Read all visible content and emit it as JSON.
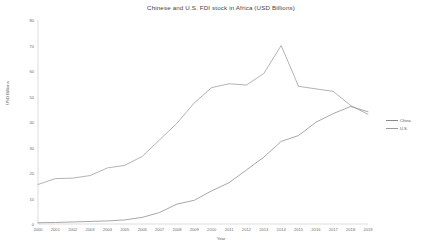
{
  "chart_data": {
    "type": "line",
    "title": "Chinese and U.S. FDI stock in Africa (USD Billions)",
    "xlabel": "Year",
    "ylabel": "USD Billions",
    "x": [
      2000,
      2001,
      2002,
      2003,
      2004,
      2005,
      2006,
      2007,
      2008,
      2009,
      2010,
      2011,
      2012,
      2013,
      2014,
      2015,
      2016,
      2017,
      2018,
      2019
    ],
    "categories": [
      "2000",
      "2001",
      "2002",
      "2003",
      "2004",
      "2005",
      "2006",
      "2007",
      "2008",
      "2009",
      "2010",
      "2011",
      "2012",
      "2013",
      "2014",
      "2015",
      "2016",
      "2017",
      "2018",
      "2019"
    ],
    "xlim": [
      2000,
      2019
    ],
    "ylim": [
      0,
      80
    ],
    "yticks": [
      0,
      10,
      20,
      30,
      40,
      50,
      60,
      70,
      80
    ],
    "ytick_labels": [
      "0",
      "10",
      "20",
      "30",
      "40",
      "50",
      "60",
      "70",
      "80"
    ],
    "grid": false,
    "legend_position": "right",
    "series": [
      {
        "name": "China",
        "color": "#8a8a8a",
        "values": [
          0.5,
          0.6,
          0.8,
          1.0,
          1.2,
          1.6,
          2.6,
          4.5,
          7.8,
          9.3,
          13.0,
          16.2,
          21.2,
          26.2,
          32.4,
          34.7,
          39.9,
          43.3,
          46.1,
          44.0
        ]
      },
      {
        "name": "U.S.",
        "color": "#9a9a9a",
        "values": [
          15.5,
          17.8,
          18.0,
          19.0,
          22.0,
          23.0,
          26.5,
          33.0,
          39.5,
          47.5,
          53.5,
          55.0,
          54.5,
          59.0,
          70.0,
          54.0,
          53.0,
          52.0,
          46.5,
          43.0
        ]
      }
    ],
    "legend": [
      {
        "label": "China",
        "color": "#8a8a8a"
      },
      {
        "label": "U.S.",
        "color": "#9a9a9a"
      }
    ]
  }
}
